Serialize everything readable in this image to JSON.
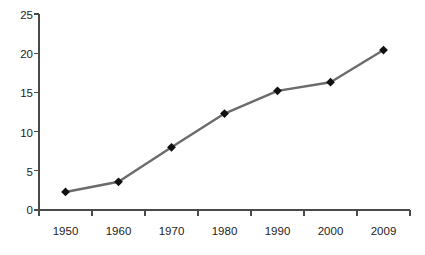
{
  "chart_data": {
    "type": "line",
    "title": "",
    "subtitle": "",
    "xlabel": "",
    "ylabel": "",
    "categories": [
      "1950",
      "1960",
      "1970",
      "1980",
      "1990",
      "2000",
      "2009"
    ],
    "values": [
      2.3,
      3.6,
      8.0,
      12.3,
      15.2,
      16.3,
      20.4
    ],
    "series": [
      {
        "name": "",
        "values": [
          2.3,
          3.6,
          8.0,
          12.3,
          15.2,
          16.3,
          20.4
        ]
      }
    ],
    "ylim": [
      0,
      25
    ],
    "y_ticks": [
      "0",
      "5",
      "10",
      "15",
      "20",
      "25"
    ],
    "x_ticks": [
      "1950",
      "1960",
      "1970",
      "1980",
      "1990",
      "2000",
      "2009"
    ],
    "grid": false,
    "legend": false,
    "legend_position": "none",
    "line_color": "#6b6b6b",
    "marker_color": "#111111",
    "marker_shape": "diamond",
    "axis_color": "#4a4a4a",
    "background_color": "#ffffff"
  }
}
